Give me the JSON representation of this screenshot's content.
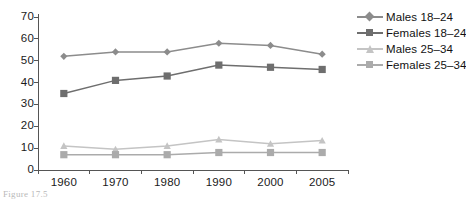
{
  "chart_data": {
    "type": "line",
    "title": "",
    "subtitle": "",
    "xlabel": "",
    "ylabel": "",
    "categories": [
      "1960",
      "1970",
      "1980",
      "1990",
      "2000",
      "2005"
    ],
    "ylim": [
      0,
      70
    ],
    "y_ticks": [
      "0",
      "10",
      "20",
      "30",
      "40",
      "50",
      "60",
      "70"
    ],
    "y_tick_values": [
      0,
      10,
      20,
      30,
      40,
      50,
      60,
      70
    ],
    "grid": false,
    "legend_position": "right",
    "series": [
      {
        "name": "Males 18–24",
        "marker": "diamond",
        "color": "#8C8C8C",
        "values": [
          52,
          54,
          54,
          58,
          57,
          53
        ]
      },
      {
        "name": "Females 18–24",
        "marker": "square",
        "color": "#6E6E6E",
        "values": [
          35,
          41,
          43,
          48,
          47,
          46
        ]
      },
      {
        "name": "Males 25–34",
        "marker": "triangle",
        "color": "#C4C4C4",
        "values": [
          11,
          9.5,
          11,
          14,
          12,
          13.5
        ]
      },
      {
        "name": "Females 25–34",
        "marker": "square",
        "color": "#ABABAB",
        "values": [
          7,
          7,
          7,
          8,
          8,
          8
        ]
      }
    ]
  },
  "axis": {
    "line_color": "#555555"
  },
  "caption": {
    "fragment": "Figure 17.5"
  }
}
